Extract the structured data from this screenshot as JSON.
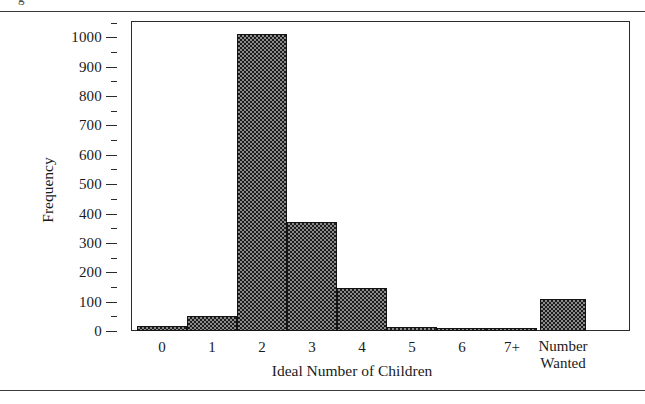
{
  "figure": {
    "caption_clipped": "g",
    "top_rule": "horizontal-rule",
    "bottom_rule": "horizontal-rule"
  },
  "chart_data": {
    "type": "bar",
    "title": "",
    "xlabel": "Ideal Number of Children",
    "ylabel": "Frequency",
    "categories": [
      "0",
      "1",
      "2",
      "3",
      "4",
      "5",
      "6",
      "7+",
      "Number\nWanted"
    ],
    "category_labels": [
      {
        "line1": "0",
        "line2": ""
      },
      {
        "line1": "1",
        "line2": ""
      },
      {
        "line1": "2",
        "line2": ""
      },
      {
        "line1": "3",
        "line2": ""
      },
      {
        "line1": "4",
        "line2": ""
      },
      {
        "line1": "5",
        "line2": ""
      },
      {
        "line1": "6",
        "line2": ""
      },
      {
        "line1": "7+",
        "line2": ""
      },
      {
        "line1": "Number",
        "line2": "Wanted"
      }
    ],
    "values": [
      18,
      50,
      1010,
      370,
      145,
      15,
      4,
      3,
      110
    ],
    "ylim": [
      0,
      1052
    ],
    "ytick_labels": [
      "0",
      "100",
      "200",
      "300",
      "400",
      "500",
      "600",
      "700",
      "800",
      "900",
      "1000"
    ],
    "ytick_values": [
      0,
      100,
      200,
      300,
      400,
      500,
      600,
      700,
      800,
      900,
      1000
    ],
    "yminor_values": [
      50,
      150,
      250,
      350,
      450,
      550,
      650,
      750,
      850,
      950,
      1050
    ],
    "grid": false,
    "legend": "none",
    "bar_fill_color": "#8a8a8a",
    "bar_pattern_color": "#1c1c1c",
    "bar_edge_color": "#141414",
    "axis_color": "#2b2b2b"
  }
}
